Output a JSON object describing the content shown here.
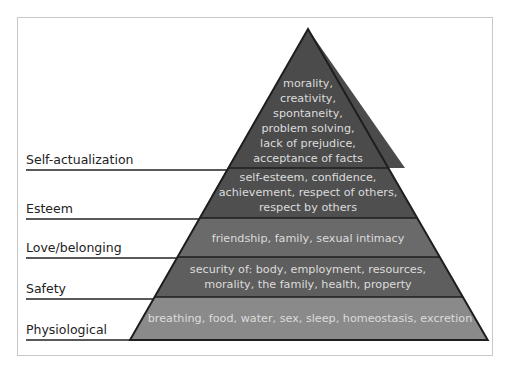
{
  "diagram": {
    "type": "pyramid",
    "levels": [
      {
        "label": "Self-actualization",
        "description_lines": [
          "morality,",
          "creativity,",
          "spontaneity,",
          "problem solving,",
          "lack of prejudice,",
          "acceptance of facts"
        ],
        "color": "#4b4b4b"
      },
      {
        "label": "Esteem",
        "description_lines": [
          "self-esteem, confidence,",
          "achievement, respect of others,",
          "respect by others"
        ],
        "color": "#4f4f4f"
      },
      {
        "label": "Love/belonging",
        "description_lines": [
          "friendship, family, sexual intimacy"
        ],
        "color": "#6a6a6a"
      },
      {
        "label": "Safety",
        "description_lines": [
          "security of: body, employment, resources,",
          "morality, the family, health, property"
        ],
        "color": "#5e5e5e"
      },
      {
        "label": "Physiological",
        "description_lines": [
          "breathing, food, water, sex, sleep, homeostasis, excretion"
        ],
        "color": "#8a8a8a"
      }
    ],
    "text_color": "#dcdcdc",
    "outline_color": "#1e1e1e"
  }
}
